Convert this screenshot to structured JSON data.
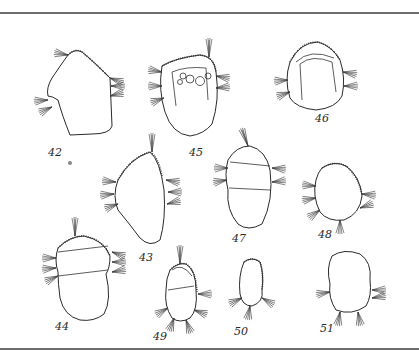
{
  "plate": {
    "background": "#ffffff",
    "rule_color": "#6e6e6e",
    "figures": [
      {
        "number": "42",
        "label_x": 48,
        "label_y": 146
      },
      {
        "number": "43",
        "label_x": 139,
        "label_y": 251
      },
      {
        "number": "44",
        "label_x": 55,
        "label_y": 320
      },
      {
        "number": "45",
        "label_x": 189,
        "label_y": 146
      },
      {
        "number": "46",
        "label_x": 315,
        "label_y": 112
      },
      {
        "number": "47",
        "label_x": 232,
        "label_y": 232
      },
      {
        "number": "48",
        "label_x": 318,
        "label_y": 228
      },
      {
        "number": "49",
        "label_x": 153,
        "label_y": 330
      },
      {
        "number": "50",
        "label_x": 234,
        "label_y": 325
      },
      {
        "number": "51",
        "label_x": 320,
        "label_y": 322
      }
    ]
  }
}
